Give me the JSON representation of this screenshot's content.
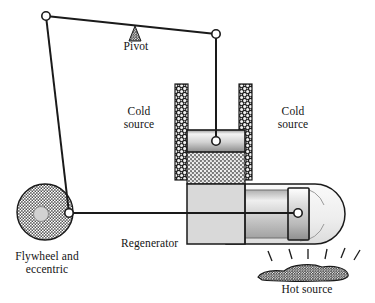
{
  "figure": {
    "type": "mechanical-diagram",
    "width": 375,
    "height": 303,
    "background": "#ffffff",
    "ink": "#1a1a1a"
  },
  "labels": {
    "pivot": "Pivot",
    "cold_source_left": "Cold\nsource",
    "cold_source_right": "Cold\nsource",
    "regenerator": "Regenerator",
    "flywheel": "Flywheel and\neccentric",
    "hot_source": "Hot source"
  },
  "colors": {
    "outline": "#1a1a1a",
    "body_fill": "#d8d8d8",
    "piston_light": "#f2f2f2",
    "piston_dark": "#8e8e8e",
    "hatch_dark": "#2b2b2b",
    "stipple": "#555555",
    "hub": "#cfcfcf",
    "joint_fill": "#ffffff"
  },
  "parts": {
    "beam": {
      "name": "walking-beam",
      "left_joint": [
        46,
        16
      ],
      "right_joint": [
        216,
        34
      ]
    },
    "pivot_marker": {
      "name": "pivot-triangle",
      "apex": [
        135,
        28
      ],
      "base_y": 40
    },
    "connecting_rod": {
      "name": "connecting-rod",
      "from": [
        46,
        16
      ],
      "to": [
        69,
        213
      ]
    },
    "piston_rod": {
      "name": "piston-rod",
      "from": [
        216,
        34
      ],
      "to": [
        216,
        141
      ]
    },
    "displacer_rod": {
      "name": "displacer-rod",
      "from": [
        69,
        213
      ],
      "to": [
        298,
        213
      ]
    },
    "flywheel": {
      "name": "flywheel",
      "center": [
        45,
        212
      ],
      "radius": 28,
      "hub_radius": 7
    },
    "crank_pin": {
      "name": "crank-pin",
      "center": [
        69,
        213
      ],
      "radius": 4
    },
    "power_cylinder": {
      "name": "power-cylinder",
      "x": 187,
      "y": 130,
      "w": 58,
      "h": 54
    },
    "power_piston": {
      "name": "power-piston",
      "x": 187,
      "y": 130,
      "w": 58,
      "h": 22
    },
    "gas_space_cold": {
      "name": "cold-gas-space",
      "x": 187,
      "y": 152,
      "w": 58,
      "h": 30
    },
    "cold_bar_left": {
      "name": "cold-source-bar-left",
      "x": 175,
      "y": 84,
      "w": 13,
      "h": 96
    },
    "cold_bar_right": {
      "name": "cold-source-bar-right",
      "x": 239,
      "y": 84,
      "w": 13,
      "h": 96
    },
    "regenerator_block": {
      "name": "regenerator-block",
      "x": 187,
      "y": 184,
      "w": 58,
      "h": 60
    },
    "hot_cylinder": {
      "name": "hot-cylinder",
      "x": 245,
      "y": 184,
      "w": 100,
      "h": 60
    },
    "displacer_piston": {
      "name": "displacer-piston",
      "x": 288,
      "y": 188,
      "w": 20,
      "h": 52
    },
    "hot_source_mound": {
      "name": "hot-source-mound",
      "cx": 305,
      "cy": 270
    },
    "flame_count": 6
  }
}
